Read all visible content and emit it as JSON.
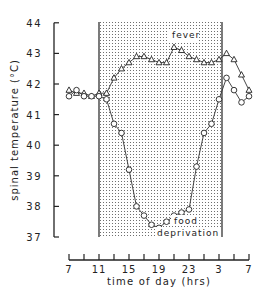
{
  "chart_data": {
    "type": "line",
    "title": "",
    "xlabel": "time of day (hrs)",
    "ylabel": "spinal temperature (°C)",
    "x_tick_labels": [
      "7",
      "11",
      "15",
      "19",
      "23",
      "3",
      "7"
    ],
    "y_tick_labels": [
      "37",
      "38",
      "39",
      "40",
      "41",
      "42",
      "43",
      "44"
    ],
    "ylim": [
      37,
      44
    ],
    "xlim_hours_elapsed": [
      0,
      24
    ],
    "grid": false,
    "shaded_region": {
      "from_hour": "11",
      "to_hour": "3",
      "pattern": "stipple",
      "label": "dark period"
    },
    "annotations": [
      "fever",
      "food deprivation"
    ],
    "series": [
      {
        "name": "fever",
        "marker": "triangle",
        "x_hours_elapsed": [
          0,
          1,
          2,
          3,
          4,
          5,
          6,
          7,
          8,
          9,
          10,
          11,
          12,
          13,
          14,
          15,
          16,
          17,
          18,
          19,
          20,
          21,
          22,
          23,
          24
        ],
        "values": [
          41.8,
          41.7,
          41.7,
          41.6,
          41.7,
          41.7,
          42.2,
          42.5,
          42.7,
          42.9,
          42.9,
          42.8,
          42.7,
          42.7,
          43.2,
          43.1,
          42.9,
          42.8,
          42.7,
          42.7,
          42.8,
          43.0,
          42.8,
          42.3,
          41.8
        ]
      },
      {
        "name": "food deprivation",
        "marker": "circle",
        "x_hours_elapsed": [
          0,
          1,
          2,
          3,
          4,
          5,
          6,
          7,
          8,
          9,
          10,
          11,
          12,
          13,
          14,
          15,
          16,
          17,
          18,
          19,
          20,
          21,
          22,
          23,
          24
        ],
        "values": [
          41.6,
          41.8,
          41.6,
          41.6,
          41.6,
          41.5,
          40.7,
          40.4,
          39.2,
          38.0,
          37.7,
          37.4,
          37.3,
          37.5,
          37.7,
          37.8,
          37.9,
          39.3,
          40.4,
          40.7,
          41.5,
          42.2,
          41.8,
          41.4,
          41.6
        ]
      }
    ]
  },
  "labels": {
    "fever": "fever",
    "food_line1": "food",
    "food_line2": "deprivation",
    "xlabel": "time of day (hrs)",
    "ylabel": "spinal temperature (°C)"
  }
}
